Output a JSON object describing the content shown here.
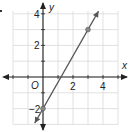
{
  "chart_data": {
    "type": "line",
    "title": "",
    "xlabel": "x",
    "ylabel": "y",
    "origin_label": "O",
    "xlim": [
      -2,
      5
    ],
    "ylim": [
      -3,
      4.2
    ],
    "grid": true,
    "x_tick_labels": [
      {
        "value": 2,
        "label": "2"
      },
      {
        "value": 4,
        "label": "4"
      }
    ],
    "y_tick_labels": [
      {
        "value": 4,
        "label": "4"
      },
      {
        "value": 2,
        "label": "2"
      },
      {
        "value": -2,
        "label": "−2"
      }
    ],
    "series": [
      {
        "name": "line",
        "slope": 1.6667,
        "intercept": -2,
        "marked_points": [
          {
            "x": 0,
            "y": -2
          },
          {
            "x": 3,
            "y": 3
          }
        ],
        "extends_with_arrows": true
      }
    ]
  },
  "colors": {
    "grid": "#d9d9d9",
    "axis": "#222222",
    "line": "#555555",
    "point": "#888888"
  }
}
